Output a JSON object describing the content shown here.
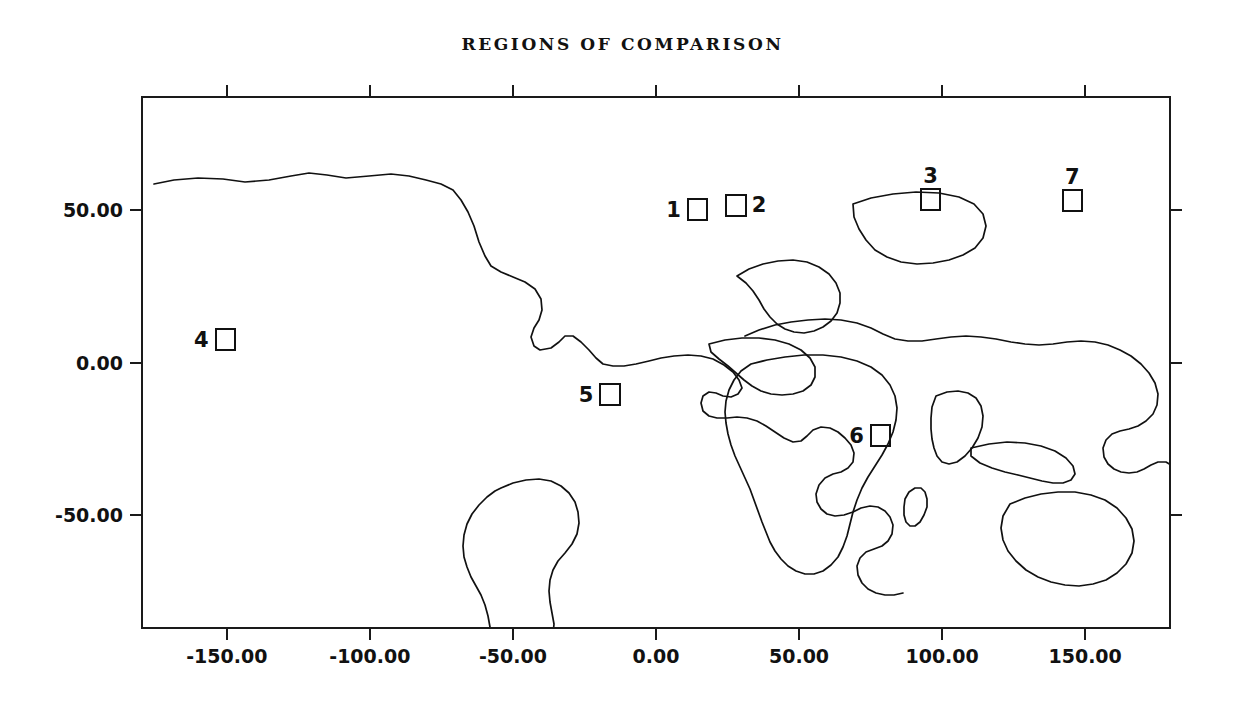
{
  "title": "REGIONS OF COMPARISON",
  "chart_data": {
    "type": "map",
    "title": "REGIONS OF COMPARISON",
    "projection": "equirectangular",
    "xlabel": "",
    "ylabel": "",
    "xlim": [
      -180,
      180
    ],
    "ylim": [
      -87.3,
      87.3
    ],
    "grid": false,
    "legend": "none",
    "xticks": [
      -150,
      -100,
      -50,
      0,
      50,
      100,
      150
    ],
    "xticklabels": [
      "-150.00",
      "-100.00",
      "-50.00",
      "0.00",
      "50.00",
      "100.00",
      "150.00"
    ],
    "yticks": [
      50,
      0,
      -50
    ],
    "yticklabels": [
      "50.00",
      "0.00",
      "-50.00"
    ],
    "series": [
      {
        "name": "regions of comparison",
        "marker": "open-square",
        "points": [
          {
            "label": "1",
            "lon": 14.5,
            "lat": 50.0,
            "label_side": "left"
          },
          {
            "label": "2",
            "lon": 28.0,
            "lat": 51.5,
            "label_side": "right"
          },
          {
            "label": "3",
            "lon": 96.0,
            "lat": 53.5,
            "label_side": "top"
          },
          {
            "label": "4",
            "lon": -150.5,
            "lat": 7.5,
            "label_side": "left"
          },
          {
            "label": "5",
            "lon": -16.0,
            "lat": -10.5,
            "label_side": "left"
          },
          {
            "label": "6",
            "lon": 78.5,
            "lat": -24.0,
            "label_side": "left"
          },
          {
            "label": "7",
            "lon": 145.5,
            "lat": 53.0,
            "label_side": "top"
          }
        ]
      }
    ]
  },
  "axes": {
    "x": {
      "ticks": [
        {
          "value": -150,
          "label": "-150.00"
        },
        {
          "value": -100,
          "label": "-100.00"
        },
        {
          "value": -50,
          "label": "-50.00"
        },
        {
          "value": 0,
          "label": "0.00"
        },
        {
          "value": 50,
          "label": "50.00"
        },
        {
          "value": 100,
          "label": "100.00"
        },
        {
          "value": 150,
          "label": "150.00"
        }
      ]
    },
    "y": {
      "ticks": [
        {
          "value": 50,
          "label": "50.00"
        },
        {
          "value": 0,
          "label": "0.00"
        },
        {
          "value": -50,
          "label": "-50.00"
        }
      ]
    }
  },
  "colors": {
    "background": "#ffffff",
    "coastline": "#111111",
    "frame": "#1a1a1a",
    "text": "#111111"
  },
  "geometry": {
    "frame_px": {
      "left": 141,
      "top": 96,
      "width": 1030,
      "height": 533
    },
    "lon_per_px": 0.34951,
    "lat_top": 87.3,
    "lat_bottom": -87.3
  },
  "regions": [
    {
      "id": "1",
      "lon": 14.5,
      "lat": 50.0,
      "size_deg": 7.5,
      "label_side": "left"
    },
    {
      "id": "2",
      "lon": 28.0,
      "lat": 51.5,
      "size_deg": 7.5,
      "label_side": "right"
    },
    {
      "id": "3",
      "lon": 96.0,
      "lat": 53.5,
      "size_deg": 7.5,
      "label_side": "top"
    },
    {
      "id": "4",
      "lon": -150.5,
      "lat": 7.5,
      "size_deg": 7.5,
      "label_side": "left"
    },
    {
      "id": "5",
      "lon": -16.0,
      "lat": -10.5,
      "size_deg": 7.5,
      "label_side": "left"
    },
    {
      "id": "6",
      "lon": 78.5,
      "lat": -24.0,
      "size_deg": 7.5,
      "label_side": "left"
    },
    {
      "id": "7",
      "lon": 145.5,
      "lat": 53.0,
      "size_deg": 7.5,
      "label_side": "top"
    }
  ],
  "coastlines": {
    "north_america": "M 13,88 L 33,84 L 57,82 L 82,83 L 104,86 L 128,84 L 150,80 L 168,77 L 186,79 L 205,82 L 228,80 L 250,78 L 268,80 L 285,84 L 300,88 L 312,94 L 320,104 L 327,116 L 333,130 L 338,146 L 344,160 L 350,170 L 360,176 L 372,181 L 384,186 L 394,193 L 400,203 L 401,214 L 398,224 L 393,232 L 390,241 L 393,250 L 399,254 L 410,252 L 418,246 L 424,240 L 432,240 L 440,246 L 448,254 L 455,262 L 462,268 L 472,270 L 483,270 L 495,268 L 508,265 L 520,262 L 533,260 L 547,259 L 560,260 L 572,263 L 583,269 L 592,276 L 598,284 L 601,292 L 597,298 L 590,301 L 582,300 L 575,297 L 568,296 L 562,300 L 560,307 L 562,315 L 568,320 L 576,322 L 586,322 L 596,321 L 606,322 L 616,325 L 625,330 L 634,336 L 643,342 L 652,346 L 660,345 L 666,340 L 672,334 L 680,331 L 689,332 L 697,336 L 704,342 L 710,349 L 713,357 L 712,366 L 707,372 L 700,376 L 692,378 L 684,382 L 678,389 L 675,398 L 676,406 L 680,413 L 686,418 L 694,420 L 703,419 L 712,416 L 720,412 L 729,410 L 737,411 L 744,415 L 749,421 L 752,429 L 751,438 L 747,445 L 741,450 L 733,453 L 725,456 L 719,462 L 716,470 L 717,479 L 721,487 L 727,493 L 735,497 L 744,499 L 753,499 L 762,497",
    "greenland_arctic": "M 712,108 L 730,102 L 752,98 L 775,96 L 798,97 L 818,101 L 833,108 L 842,118 L 845,130 L 842,142 L 834,152 L 822,159 L 808,164 L 792,167 L 776,168 L 760,166 L 746,161 L 734,154 L 725,144 L 718,133 L 713,121 Z",
    "south_america": "M 360,392 L 372,387 L 385,384 L 398,383 L 410,385 L 420,390 L 428,397 L 434,406 L 437,416 L 438,427 L 436,438 L 431,448 L 424,457 L 417,465 L 412,474 L 409,484 L 408,495 L 409,506 L 411,517 L 413,528 L 412,539 L 408,549 L 402,557 L 395,563 L 387,567 L 379,569 L 371,568 L 364,564 L 358,558 L 354,550 L 351,541 L 349,531 L 347,520 L 344,509 L 340,499 L 335,490 L 330,481 L 326,471 L 323,461 L 322,450 L 323,439 L 326,428 L 331,418 L 338,409 L 346,401 L 354,395 Z",
    "africa": "M 610,268 L 626,264 L 644,261 L 663,259 L 682,259 L 700,261 L 716,265 L 730,271 L 741,279 L 749,289 L 754,300 L 756,312 L 755,324 L 752,336 L 747,348 L 741,359 L 734,370 L 727,381 L 721,392 L 716,404 L 712,416 L 709,428 L 706,440 L 702,451 L 697,461 L 690,469 L 682,475 L 673,478 L 664,478 L 655,475 L 647,470 L 640,463 L 634,455 L 629,446 L 625,436 L 621,426 L 617,415 L 613,404 L 609,393 L 604,382 L 599,371 L 594,360 L 590,349 L 587,338 L 585,327 L 584,316 L 585,305 L 588,294 L 593,284 L 600,275 Z",
    "madagascar": "M 768,396 L 774,392 L 780,392 L 784,396 L 786,403 L 786,411 L 783,419 L 779,426 L 774,430 L 769,430 L 765,426 L 763,419 L 763,411 L 764,403 Z",
    "eurasia": "M 604,240 L 618,234 L 634,229 L 650,226 L 667,224 L 684,223 L 700,224 L 716,227 L 730,232 L 742,238 L 754,243 L 767,245 L 781,245 L 795,243 L 810,241 L 825,240 L 840,241 L 855,243 L 870,246 L 884,248 L 898,249 L 912,248 L 926,246 L 940,245 L 954,246 L 967,249 L 979,254 L 990,260 L 1000,268 L 1008,277 L 1014,287 L 1017,298 L 1016,309 L 1012,318 L 1005,325 L 997,330 L 988,333 L 979,335 L 971,338 L 965,344 L 962,352 L 963,361 L 967,368 L 973,373 L 980,376 L 988,377 L 996,376 L 1003,373 L 1010,369 L 1017,366 L 1025,366 L 1030,369",
    "europe_north": "M 596,180 L 608,173 L 622,168 L 637,165 L 652,164 L 666,166 L 678,171 L 688,178 L 695,187 L 699,197 L 699,207 L 696,217 L 690,225 L 682,231 L 673,235 L 663,237 L 653,236 L 644,233 L 636,228 L 629,221 L 623,213 L 618,204 L 612,195 L 605,187 Z",
    "mediterranean": "M 568,248 L 584,244 L 601,242 L 618,242 L 634,244 L 648,248 L 660,254 L 669,262 L 674,271 L 674,281 L 670,289 L 662,295 L 652,298 L 641,299 L 630,298 L 620,295 L 611,290 L 603,284 L 595,277 L 587,270 L 578,263 L 570,256 Z",
    "india": "M 795,300 L 806,296 L 817,295 L 827,297 L 835,302 L 840,310 L 842,320 L 841,331 L 837,342 L 831,352 L 824,360 L 816,366 L 808,368 L 801,366 L 796,360 L 793,352 L 791,343 L 790,333 L 790,322 L 791,311 Z",
    "australia": "M 869,408 L 884,402 L 900,398 L 917,396 L 934,396 L 950,399 L 964,404 L 976,412 L 985,422 L 991,433 L 993,445 L 991,457 L 985,468 L 976,477 L 965,484 L 952,488 L 938,490 L 924,489 L 910,486 L 897,481 L 885,474 L 875,465 L 867,455 L 862,444 L 860,432 L 862,420 Z",
    "indonesia": "M 830,352 L 848,348 L 866,346 L 884,347 L 900,350 L 914,355 L 925,362 L 932,370 L 934,378 L 930,384 L 922,387 L 912,387 L 901,385 L 889,382 L 877,379 L 864,376 L 851,372 L 839,367 L 830,360 Z",
    "japan": "M 1046,230 L 1054,224 L 1062,221 L 1069,222 L 1074,227 L 1076,235 L 1075,244 L 1071,253 L 1065,261 L 1058,267 L 1051,270 L 1045,269 L 1041,264 L 1040,256 L 1041,247 L 1043,238 Z",
    "antarctica": "M 0,572 L 24,566 L 52,561 L 84,557 L 118,554 L 154,552 L 192,551 L 230,551 L 268,552 L 306,554 L 344,556 L 382,557 L 420,557 L 458,556 L 496,554 L 534,552 L 572,550 L 610,549 L 648,549 L 686,550 L 724,552 L 762,554 L 800,556 L 838,557 L 876,558 L 914,558 L 952,557 L 990,556 L 1030,555 L 1030,604 L 0,604 Z"
  }
}
